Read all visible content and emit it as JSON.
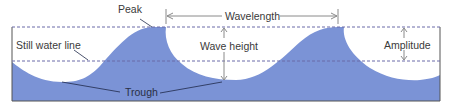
{
  "diagram": {
    "labels": {
      "peak": "Peak",
      "wavelength": "Wavelength",
      "still_water_line": "Still water line",
      "wave_height": "Wave height",
      "amplitude": "Amplitude",
      "trough": "Trough"
    },
    "colors": {
      "water": "#7b93d6",
      "frame": "#555555",
      "dashed_line": "#6a6aa8",
      "leader_line": "#1f2a4a",
      "arrow": "#8a8a8a",
      "text": "#3a3a3a"
    }
  }
}
